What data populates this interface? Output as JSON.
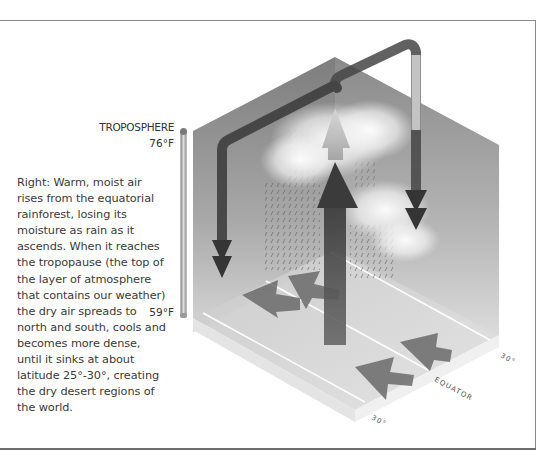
{
  "caption": {
    "text": "Right: Warm, moist air rises from the equatorial rainforest, losing its moisture as rain as it ascends. When it reaches the tropopause (the top of the layer of atmosphere that contains our weather) the dry air spreads to north and south, cools and becomes more dense, until it sinks at about latitude 25°-30°, creating the dry desert regions of the world."
  },
  "scale": {
    "layer_label": "TROPOSPHERE",
    "top_temp": "76°F",
    "bottom_temp": "59°F"
  },
  "diagram": {
    "type": "isometric atmospheric circulation (Hadley cell)",
    "latitude_labels": {
      "north": "30°",
      "equator": "EQUATOR",
      "south": "30°"
    },
    "elements": [
      "rising air arrow",
      "clouds",
      "rain streaks",
      "descending air arrows",
      "surface converging arrows"
    ],
    "colors": {
      "arrow_dark": "#3c3c3c",
      "wall_gray": "#8e8e8e",
      "floor_light": "#d4d4d4",
      "frame": "#8a8a8a"
    }
  }
}
